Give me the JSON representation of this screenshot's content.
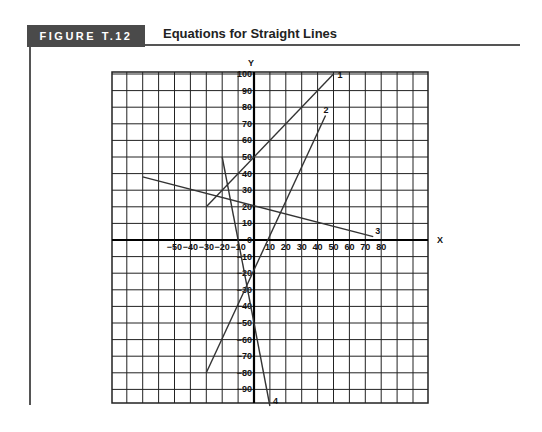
{
  "header": {
    "figure_label": "FIGURE T.12",
    "title": "Equations for Straight Lines"
  },
  "colors": {
    "badge_bg": "#4a4a4a",
    "grid": "#222222",
    "line": "#333333"
  },
  "chart_data": {
    "type": "line",
    "title": "Equations for Straight Lines",
    "xlabel": "X",
    "ylabel": "Y",
    "xlim": [
      -80,
      100
    ],
    "ylim": [
      -100,
      100
    ],
    "grid": true,
    "x_ticks": [
      -50,
      -40,
      -30,
      -20,
      -10,
      10,
      20,
      30,
      40,
      50,
      60,
      70,
      80
    ],
    "y_ticks": [
      100,
      90,
      80,
      70,
      60,
      50,
      40,
      30,
      20,
      10,
      0,
      -10,
      -20,
      -30,
      -40,
      -50,
      -60,
      -70,
      -80,
      -90
    ],
    "series": [
      {
        "name": "1",
        "points": [
          [
            -30,
            20
          ],
          [
            50,
            100
          ]
        ],
        "equation": "y = x + 50"
      },
      {
        "name": "2",
        "points": [
          [
            -30,
            -80
          ],
          [
            45,
            75
          ]
        ],
        "equation": "y ≈ 2x - 20"
      },
      {
        "name": "3",
        "points": [
          [
            -70,
            38
          ],
          [
            75,
            2
          ]
        ],
        "equation": "y ≈ -0.25x + 20"
      },
      {
        "name": "4",
        "points": [
          [
            -20,
            50
          ],
          [
            10,
            -100
          ]
        ],
        "equation": "y = -5x - 50"
      }
    ]
  }
}
